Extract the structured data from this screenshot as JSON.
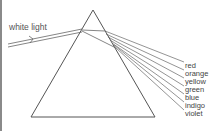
{
  "diagram": {
    "input_label": "white light",
    "spectrum_labels": [
      "red",
      "orange",
      "yellow",
      "green",
      "blue",
      "indigo",
      "violet"
    ],
    "colors": {
      "line": "#555555",
      "text": "#444444",
      "border": "#8a8a8a",
      "background": "#ffffff"
    }
  }
}
